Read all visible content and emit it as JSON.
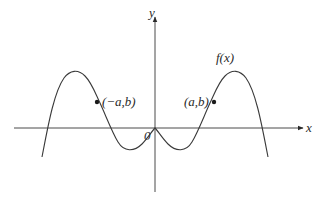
{
  "diagram": {
    "type": "function-graph",
    "axes": {
      "x_label": "x",
      "y_label": "y",
      "origin_label": "0"
    },
    "function_label": "f(x)",
    "points": [
      {
        "label": "(−a,b)",
        "x": "-a",
        "y": "b"
      },
      {
        "label": "(a,b)",
        "x": "a",
        "y": "b"
      }
    ],
    "colors": {
      "background": "#ffffff",
      "line": "#3a3a3a",
      "text": "#2a2a2a"
    }
  }
}
